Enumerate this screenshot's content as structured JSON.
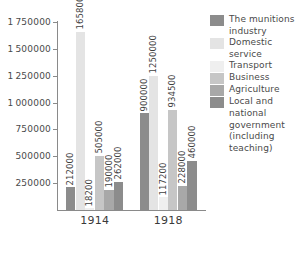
{
  "chart_data": {
    "type": "bar",
    "title": "",
    "xlabel": "",
    "ylabel": "",
    "categories": [
      "1914",
      "1918"
    ],
    "ylim": [
      0,
      1750000
    ],
    "ytick_values": [
      250000,
      500000,
      750000,
      1000000,
      1250000,
      1500000,
      1750000
    ],
    "ytick_labels": [
      "250000",
      "500000",
      "750000",
      "1000000",
      "1250000",
      "1500000",
      "1750000"
    ],
    "grid": false,
    "legend_position": "right",
    "series": [
      {
        "name": "The munitions industry",
        "color": "#8c8c8c",
        "values": [
          212000,
          900000
        ],
        "labels": [
          "212000",
          "900000"
        ]
      },
      {
        "name": "Domestic service",
        "color": "#e4e4e4",
        "values": [
          1658000,
          1250000
        ],
        "labels": [
          "1658000",
          "1250000"
        ]
      },
      {
        "name": "Transport",
        "color": "#efefef",
        "values": [
          18200,
          117200
        ],
        "labels": [
          "18200",
          "117200"
        ]
      },
      {
        "name": "Business",
        "color": "#c6c6c6",
        "values": [
          505000,
          934500
        ],
        "labels": [
          "505000",
          "934500"
        ]
      },
      {
        "name": "Agriculture",
        "color": "#a8a8a8",
        "values": [
          190000,
          228000
        ],
        "labels": [
          "190000",
          "228000"
        ]
      },
      {
        "name": "Local and national government (including teaching)",
        "color": "#8c8c8c",
        "values": [
          262000,
          460000
        ],
        "labels": [
          "262000",
          "460000"
        ]
      }
    ]
  },
  "legend": {
    "items": [
      {
        "label": "The munitions industry",
        "color": "#8c8c8c"
      },
      {
        "label": "Domestic service",
        "color": "#e4e4e4"
      },
      {
        "label": "Transport",
        "color": "#efefef"
      },
      {
        "label": "Business",
        "color": "#c6c6c6"
      },
      {
        "label": "Agriculture",
        "color": "#a8a8a8"
      },
      {
        "label": "Local and national government (including teaching)",
        "color": "#8c8c8c"
      }
    ]
  },
  "axes": {
    "x_labels": [
      "1914",
      "1918"
    ],
    "y_labels": [
      "1750000",
      "1500000",
      "1250000",
      "1000000",
      "750000",
      "500000",
      "250000"
    ]
  }
}
